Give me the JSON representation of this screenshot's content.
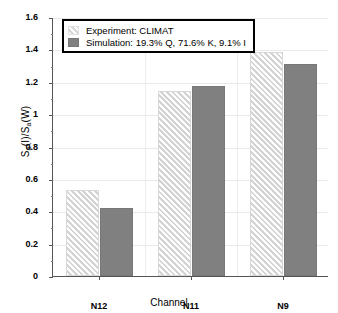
{
  "chart_data": {
    "type": "bar",
    "title": "",
    "xlabel": "Channel",
    "ylabel": "S_a(I)/S_a(W)",
    "ylabel_parts": {
      "s1": "S",
      "sub1": "a",
      "mid": "(I)/S",
      "sub2": "a",
      "end": "(W)"
    },
    "categories": [
      "N12",
      "N11",
      "N9"
    ],
    "series": [
      {
        "name": "Experiment: CLIMAT",
        "values": [
          0.53,
          1.145,
          1.385
        ],
        "color": "#ededed",
        "pattern": "diagonal-hatch"
      },
      {
        "name": "Simulation: 19.3% Q, 71.6% K, 9.1% I",
        "values": [
          0.42,
          1.175,
          1.31
        ],
        "color": "#808080",
        "pattern": "solid"
      }
    ],
    "ylim": [
      0,
      1.6
    ],
    "ytick_labels": [
      "0",
      "0.2",
      "0.4",
      "0.6",
      "0.8",
      "1",
      "1.2",
      "1.4",
      "1.6"
    ],
    "ytick_values": [
      0,
      0.2,
      0.4,
      0.6,
      0.8,
      1.0,
      1.2,
      1.4,
      1.6
    ],
    "grid": true,
    "legend_position": "top-left"
  },
  "legend": {
    "entries": [
      {
        "label": "Experiment: CLIMAT",
        "swatch": "exp"
      },
      {
        "label": "Simulation: 19.3% Q, 71.6% K, 9.1% I",
        "swatch": "sim"
      }
    ]
  },
  "axes": {
    "x_label": "Channel",
    "y_ticks": [
      "1.6",
      "1.4",
      "1.2",
      "1",
      "0.8",
      "0.6",
      "0.4",
      "0.2",
      "0"
    ],
    "x_ticks": [
      "N12",
      "N11",
      "N9"
    ]
  }
}
